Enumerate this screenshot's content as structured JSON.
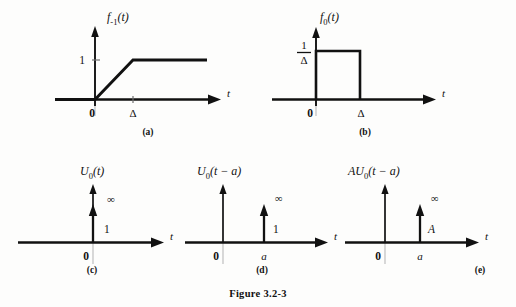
{
  "figure": {
    "caption": "Figure 3.2-3",
    "background_color": "#fdfdfc",
    "ink_color": "#111111",
    "ghost_axis_color": "#b9b9b9"
  },
  "panels": [
    {
      "key": "a",
      "caption": "(a)",
      "title": "f",
      "title_sub": "-1",
      "title_arg": "(t)",
      "title_plain": "f_-1(t)",
      "axis_x_label": "t",
      "origin_label": "0",
      "tick_labels": {
        "x": "Δ",
        "y": "1"
      },
      "description": "unit ramp rising from 0 to 1 over interval 0 to Delta, constant at 1 thereafter"
    },
    {
      "key": "b",
      "caption": "(b)",
      "title": "f",
      "title_sub": "0",
      "title_arg": "(t)",
      "title_plain": "f_0(t)",
      "axis_x_label": "t",
      "origin_label": "0",
      "tick_labels": {
        "x": "Δ",
        "y_numerator": "1",
        "y_denominator": "Δ"
      },
      "description": "rectangular pulse of height 1/Delta from t=0 to t=Delta"
    },
    {
      "key": "c",
      "caption": "(c)",
      "title": "U",
      "title_sub": "0",
      "title_arg": "(t)",
      "title_plain": "U_0(t)",
      "axis_x_label": "t",
      "origin_label": "0",
      "impulse": {
        "position_label": "",
        "strength_label": "1",
        "height_label": "∞"
      },
      "description": "unit impulse at t=0 with infinite height and area 1"
    },
    {
      "key": "d",
      "caption": "(d)",
      "title": "U",
      "title_sub": "0",
      "title_arg": "(t − a)",
      "title_plain": "U_0(t - a)",
      "axis_x_label": "t",
      "origin_label": "0",
      "impulse": {
        "position_label": "a",
        "strength_label": "1",
        "height_label": "∞"
      },
      "description": "unit impulse shifted to t=a with area 1"
    },
    {
      "key": "e",
      "caption": "(e)",
      "title": "AU",
      "title_sub": "0",
      "title_arg": "(t − a)",
      "title_plain": "AU_0(t - a)",
      "axis_x_label": "t",
      "origin_label": "0",
      "impulse": {
        "position_label": "a",
        "strength_label": "A",
        "height_label": "∞"
      },
      "description": "scaled impulse at t=a with area A"
    }
  ]
}
